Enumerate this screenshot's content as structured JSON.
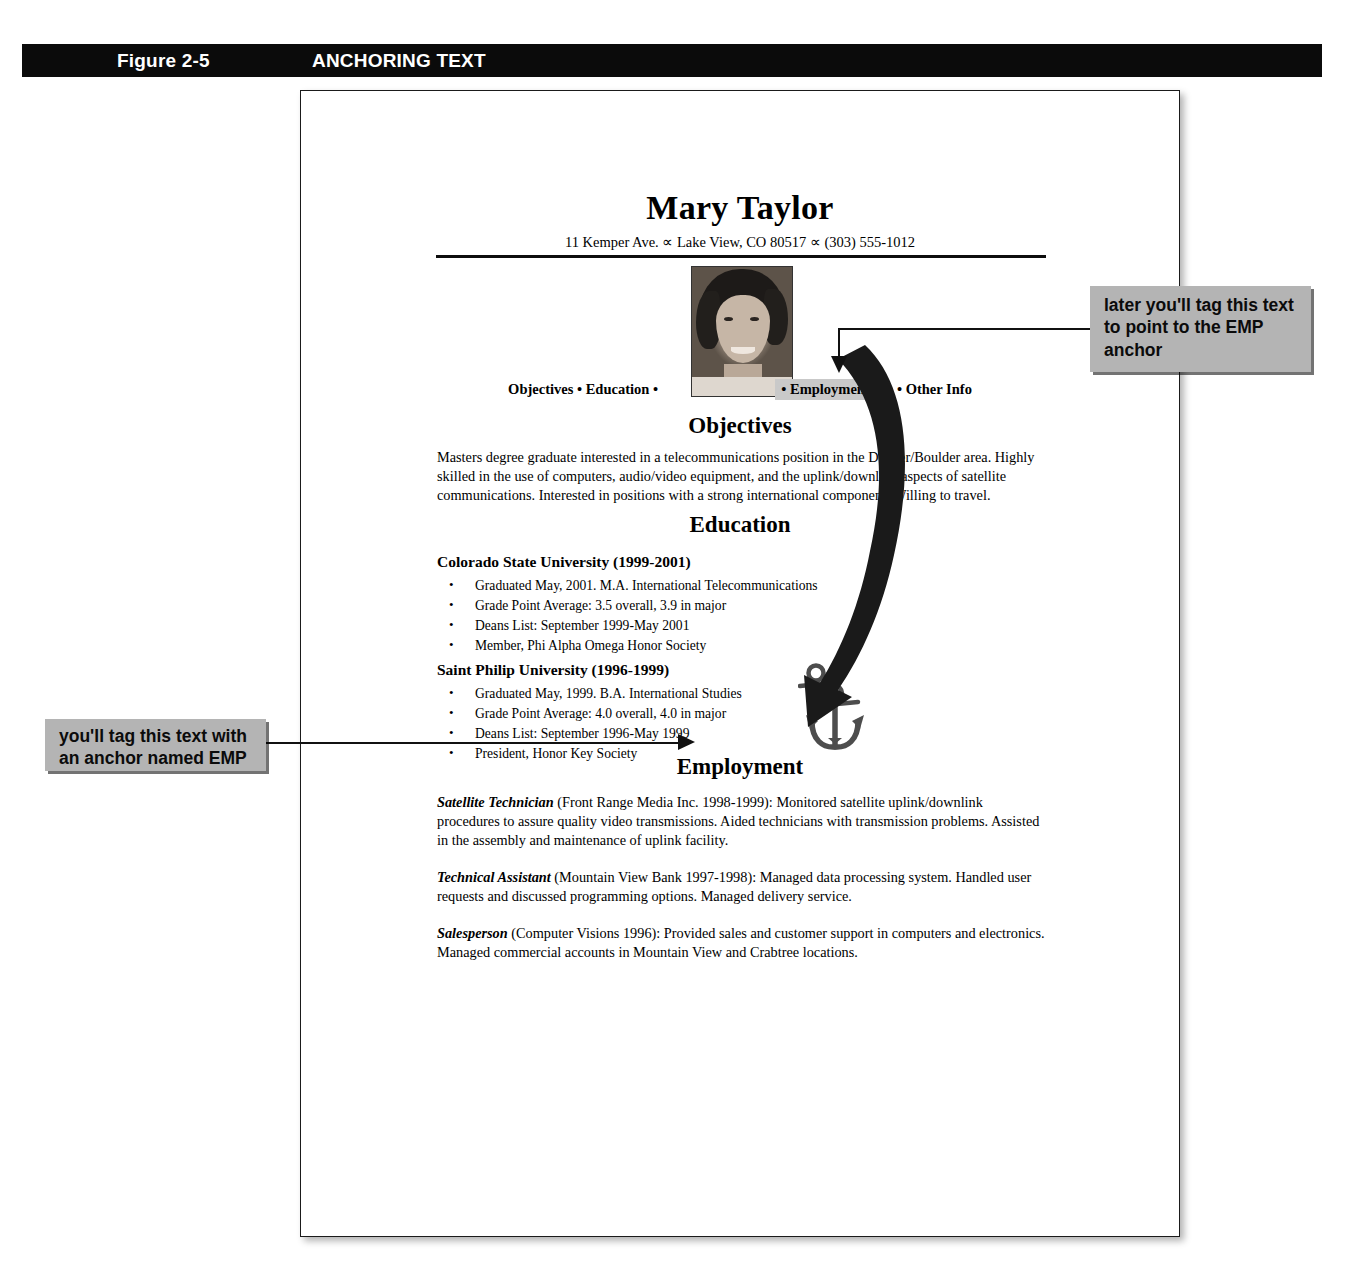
{
  "figure": {
    "number": "Figure 2-5",
    "title": "ANCHORING TEXT"
  },
  "resume": {
    "name": "Mary Taylor",
    "contact": "11 Kemper Ave. ∝ Lake View, CO 80517 ∝ (303) 555-1012",
    "photo_alt": "portrait-photo",
    "nav": {
      "before": "Objectives • Education •",
      "highlighted": "• Employment",
      "after": "• Other Info"
    },
    "sections": [
      {
        "heading": "Objectives",
        "body": "Masters degree graduate interested in a telecommunications position in the Denver/Boulder area. Highly skilled in the use of computers, audio/video equipment, and the uplink/downlink aspects of satellite communications. Interested in positions with a strong international component. Willing to travel."
      },
      {
        "heading": "Education",
        "schools": [
          {
            "name": "Colorado State University (1999-2001)",
            "bullets": [
              "Graduated May, 2001. M.A. International Telecommunications",
              "Grade Point Average: 3.5 overall, 3.9 in major",
              "Deans List: September 1999-May 2001",
              "Member, Phi Alpha Omega Honor Society"
            ]
          },
          {
            "name": "Saint Philip University (1996-1999)",
            "bullets": [
              "Graduated May, 1999. B.A. International Studies",
              "Grade Point Average: 4.0 overall, 4.0 in major",
              "Deans List: September 1996-May 1999",
              "President, Honor Key Society"
            ]
          }
        ]
      },
      {
        "heading": "Employment",
        "jobs": [
          {
            "title": "Satellite Technician",
            "detail": " (Front Range Media Inc. 1998-1999): Monitored satellite uplink/downlink procedures to assure quality video transmissions. Aided technicians with transmission problems. Assisted in the assembly and maintenance of uplink facility."
          },
          {
            "title": "Technical Assistant",
            "detail": " (Mountain View Bank 1997-1998): Managed data processing system. Handled user requests and discussed programming options. Managed delivery service."
          },
          {
            "title": "Salesperson",
            "detail": " (Computer Visions 1996): Provided sales and customer support in computers and electronics. Managed commercial accounts in Mountain View and Crabtree locations."
          }
        ]
      }
    ]
  },
  "callouts": {
    "right": "later you'll tag this text to point to the EMP anchor",
    "left": "you'll tag this text with an anchor named EMP"
  },
  "colors": {
    "bar_background": "#0b0b0b",
    "bar_text": "#ffffff",
    "callout_background": "#b4b4b4",
    "highlight_background": "#c9c9c9",
    "page_border": "#1a1a1a",
    "arrow": "#1a1a1a",
    "anchor": "#4d4d4d"
  }
}
